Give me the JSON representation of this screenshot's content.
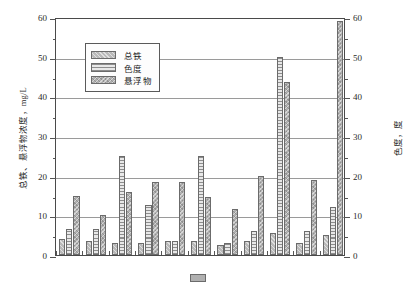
{
  "chart_data": {
    "type": "bar",
    "title": "",
    "subtitle": "",
    "xlabel": "",
    "ylabel": "总铁、悬浮物浓度，mg/L",
    "y2label": "色度，度",
    "ylim": [
      0,
      60
    ],
    "y2lim": [
      0,
      60
    ],
    "grid": true,
    "legend_position": "upper-left-inside",
    "categories": [
      "1",
      "2",
      "3",
      "4",
      "5",
      "6",
      "7",
      "8",
      "9",
      "10",
      "11"
    ],
    "yticks": [
      "0",
      "10",
      "20",
      "30",
      "40",
      "50",
      "60"
    ],
    "y2ticks": [
      "0",
      "10",
      "20",
      "30",
      "40",
      "50",
      "60"
    ],
    "minor_tick_step": 5,
    "series": [
      {
        "name": "总铁",
        "axis": "left",
        "unit": "mg/L",
        "pattern": "diagonal-hatch",
        "color": "#b9b9b9",
        "values": [
          4,
          3.5,
          3,
          3,
          3.5,
          3.5,
          2.5,
          3.5,
          5.5,
          3,
          5
        ]
      },
      {
        "name": "色度",
        "axis": "right",
        "unit": "度",
        "pattern": "horizontal-lines",
        "color": "#e8e8e8",
        "values": [
          6.5,
          6.5,
          25,
          12.5,
          3.5,
          25,
          3,
          6,
          50,
          6,
          12
        ]
      },
      {
        "name": "悬浮物",
        "axis": "left",
        "unit": "mg/L",
        "pattern": "cross-hatch",
        "color": "#b0b0b0",
        "values": [
          15,
          10,
          16,
          18.5,
          18.5,
          14.5,
          11.5,
          20,
          43.5,
          19,
          59
        ]
      }
    ]
  },
  "legend": {
    "items": [
      {
        "label": "总铁"
      },
      {
        "label": "色度"
      },
      {
        "label": "悬浮物"
      }
    ]
  },
  "caption": {
    "text": ""
  }
}
